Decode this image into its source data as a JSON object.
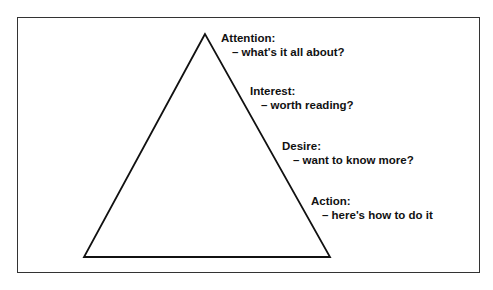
{
  "diagram": {
    "type": "AIDA pyramid",
    "shape": "triangle",
    "stroke_color": "#111111",
    "frame_color": "#333333",
    "stages": [
      {
        "title": "Attention:",
        "desc": "– what's it all about?"
      },
      {
        "title": "Interest:",
        "desc": "– worth reading?"
      },
      {
        "title": "Desire:",
        "desc": "– want to know more?"
      },
      {
        "title": "Action:",
        "desc": "– here's how to do it"
      }
    ]
  }
}
